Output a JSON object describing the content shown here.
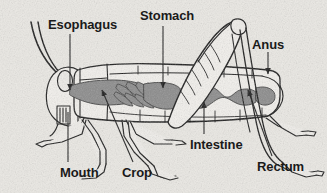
{
  "diagram": {
    "background_color": "#ebe9e4",
    "ink_color": "#1a1a1a",
    "gut_fill_color": "#8a8a8a",
    "body_fill_color": "#f2f0ec",
    "labels": [
      {
        "id": "esophagus",
        "text": "Esophagus",
        "x": 48,
        "y": 18,
        "font_size": 13
      },
      {
        "id": "stomach",
        "text": "Stomach",
        "x": 140,
        "y": 9,
        "font_size": 13
      },
      {
        "id": "anus",
        "text": "Anus",
        "x": 252,
        "y": 38,
        "font_size": 13
      },
      {
        "id": "intestine",
        "text": "Intestine",
        "x": 190,
        "y": 138,
        "font_size": 13
      },
      {
        "id": "rectum",
        "text": "Rectum",
        "x": 257,
        "y": 160,
        "font_size": 13
      },
      {
        "id": "mouth",
        "text": "Mouth",
        "x": 60,
        "y": 166,
        "font_size": 13
      },
      {
        "id": "crop",
        "text": "Crop",
        "x": 122,
        "y": 166,
        "font_size": 13
      }
    ],
    "leader_lines": [
      {
        "for": "esophagus",
        "from": [
          70,
          34
        ],
        "to": [
          70,
          92
        ],
        "arrow": true
      },
      {
        "for": "stomach",
        "from": [
          163,
          26
        ],
        "to": [
          163,
          90
        ],
        "arrow": true
      },
      {
        "for": "anus",
        "from": [
          268,
          52
        ],
        "to": [
          268,
          76
        ],
        "arrow": true
      },
      {
        "for": "intestine",
        "from": [
          204,
          134
        ],
        "to": [
          204,
          100
        ],
        "arrow": true
      },
      {
        "for": "rectum",
        "from": [
          272,
          156
        ],
        "to": [
          247,
          88
        ],
        "arrow": true
      },
      {
        "for": "mouth",
        "from": [
          68,
          162
        ],
        "to": [
          68,
          112
        ],
        "arrow": false
      },
      {
        "for": "crop",
        "from": [
          133,
          162
        ],
        "to": [
          101,
          88
        ],
        "arrow": true
      }
    ]
  }
}
